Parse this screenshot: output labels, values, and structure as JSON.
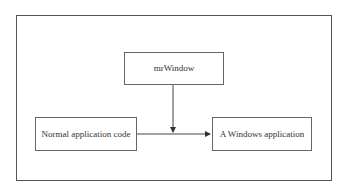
{
  "diagram": {
    "nodes": [
      {
        "id": "mrwindow",
        "label": "mrWindow"
      },
      {
        "id": "normal",
        "label": "Normal application code"
      },
      {
        "id": "windows_app",
        "label": "A Windows application"
      }
    ],
    "edges": [
      {
        "from": "normal",
        "to": "windows_app"
      },
      {
        "from": "mrwindow",
        "to": "edge-normal-windows_app"
      }
    ],
    "colors": {
      "stroke": "#555555",
      "text": "#333333",
      "background": "#ffffff"
    }
  }
}
